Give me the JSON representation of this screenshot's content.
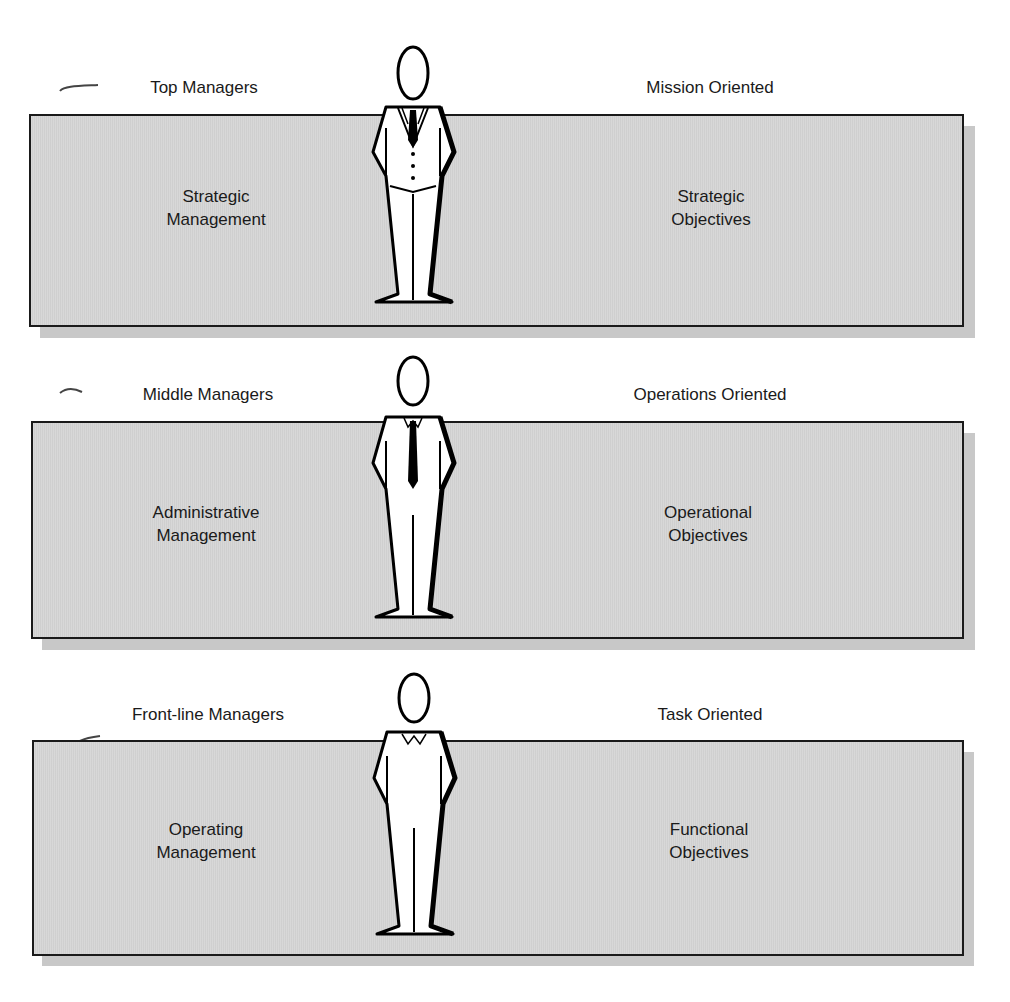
{
  "page": {
    "title_fragment": "Appr...g..."
  },
  "tiers": [
    {
      "level": "Top Managers",
      "orientation": "Mission Oriented",
      "management_line1": "Strategic",
      "management_line2": "Management",
      "objectives_line1": "Strategic",
      "objectives_line2": "Objectives",
      "figure_attire": "three-piece suit with tie"
    },
    {
      "level": "Middle Managers",
      "orientation": "Operations Oriented",
      "management_line1": "Administrative",
      "management_line2": "Management",
      "objectives_line1": "Operational",
      "objectives_line2": "Objectives",
      "figure_attire": "shirt with long tie"
    },
    {
      "level": "Front-line Managers",
      "orientation": "Task Oriented",
      "management_line1": "Operating",
      "management_line2": "Management",
      "objectives_line1": "Functional",
      "objectives_line2": "Objectives",
      "figure_attire": "shirt with open collar"
    }
  ],
  "colors": {
    "box_fill": "#d6d6d6",
    "box_border": "#1a1a1a",
    "shadow": "#c8c8c8",
    "figure_fill": "#ffffff",
    "figure_stroke": "#000000"
  }
}
